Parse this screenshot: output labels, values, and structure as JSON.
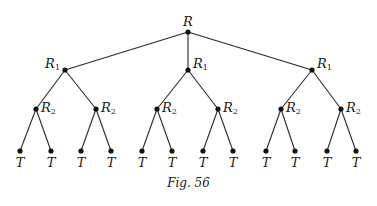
{
  "figure": {
    "caption": "Fig. 56",
    "root": {
      "label": "R",
      "x": 188,
      "y": 32
    },
    "level1": [
      {
        "label": "R",
        "sub": "1",
        "x": 65,
        "y": 70,
        "label_side": "left"
      },
      {
        "label": "R",
        "sub": "1",
        "x": 188,
        "y": 70,
        "label_side": "right"
      },
      {
        "label": "R",
        "sub": "1",
        "x": 312,
        "y": 70,
        "label_side": "right"
      }
    ],
    "level2": [
      {
        "label": "R",
        "sub": "2",
        "x": 36,
        "y": 109,
        "parent": 0
      },
      {
        "label": "R",
        "sub": "2",
        "x": 96,
        "y": 109,
        "parent": 0
      },
      {
        "label": "R",
        "sub": "2",
        "x": 157,
        "y": 109,
        "parent": 1
      },
      {
        "label": "R",
        "sub": "2",
        "x": 218,
        "y": 109,
        "parent": 1
      },
      {
        "label": "R",
        "sub": "2",
        "x": 281,
        "y": 109,
        "parent": 2
      },
      {
        "label": "R",
        "sub": "2",
        "x": 341,
        "y": 109,
        "parent": 2
      }
    ],
    "leaves": [
      {
        "label": "T",
        "x": 20,
        "parent": 0
      },
      {
        "label": "T",
        "x": 51,
        "parent": 0
      },
      {
        "label": "T",
        "x": 81,
        "parent": 1
      },
      {
        "label": "T",
        "x": 111,
        "parent": 1
      },
      {
        "label": "T",
        "x": 142,
        "parent": 2
      },
      {
        "label": "T",
        "x": 172,
        "parent": 2
      },
      {
        "label": "T",
        "x": 203,
        "parent": 3
      },
      {
        "label": "T",
        "x": 233,
        "parent": 3
      },
      {
        "label": "T",
        "x": 266,
        "parent": 4
      },
      {
        "label": "T",
        "x": 295,
        "parent": 4
      },
      {
        "label": "T",
        "x": 327,
        "parent": 5
      },
      {
        "label": "T",
        "x": 356,
        "parent": 5
      }
    ],
    "leaf_y": 151,
    "leaf_label_y": 167
  }
}
